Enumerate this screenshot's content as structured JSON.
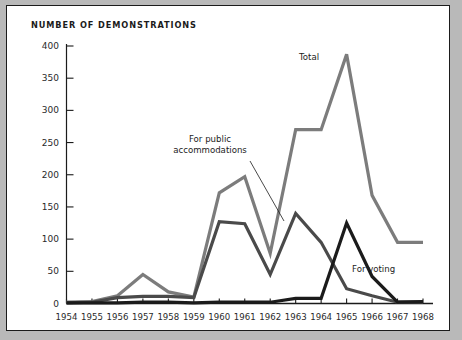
{
  "figure": {
    "title": "NUMBER OF DEMONSTRATIONS",
    "background": "#ffffff",
    "border_color": "#1b1b1b",
    "page_background": "#b9b9b9"
  },
  "annotations": {
    "total": "Total",
    "public_accommodations_line1": "For public",
    "public_accommodations_line2": "accommodations",
    "voting": "For voting"
  },
  "chart_data": {
    "type": "line",
    "title": "NUMBER OF DEMONSTRATIONS",
    "xlabel": "",
    "ylabel": "",
    "x": [
      1954,
      1955,
      1956,
      1957,
      1958,
      1959,
      1960,
      1961,
      1962,
      1963,
      1964,
      1965,
      1966,
      1967,
      1968
    ],
    "xtick_labels": [
      "1954",
      "1955",
      "1956",
      "1957",
      "1958",
      "1959",
      "1960",
      "1961",
      "1962",
      "1963",
      "1964",
      "1965",
      "1966",
      "1967",
      "1968"
    ],
    "ytick_labels": [
      "0",
      "50",
      "100",
      "150",
      "200",
      "250",
      "300",
      "350",
      "400"
    ],
    "yticks": [
      0,
      50,
      100,
      150,
      200,
      250,
      300,
      350,
      400
    ],
    "ylim": [
      0,
      400
    ],
    "xlim": [
      1954,
      1968
    ],
    "grid": false,
    "legend_position": "inline-annotations",
    "series": [
      {
        "name": "Total",
        "color": "#7c7c7c",
        "width": 3.2,
        "values": [
          2,
          3,
          12,
          45,
          18,
          10,
          172,
          197,
          78,
          270,
          270,
          387,
          168,
          95,
          95
        ]
      },
      {
        "name": "For public accommodations",
        "color": "#4a4a4a",
        "width": 3.2,
        "values": [
          1,
          2,
          9,
          11,
          11,
          9,
          127,
          124,
          45,
          140,
          95,
          23,
          12,
          2,
          2
        ]
      },
      {
        "name": "For voting",
        "color": "#1b1b1b",
        "width": 3.2,
        "values": [
          1,
          1,
          1,
          2,
          2,
          1,
          2,
          2,
          2,
          8,
          8,
          125,
          42,
          2,
          3
        ]
      }
    ]
  }
}
